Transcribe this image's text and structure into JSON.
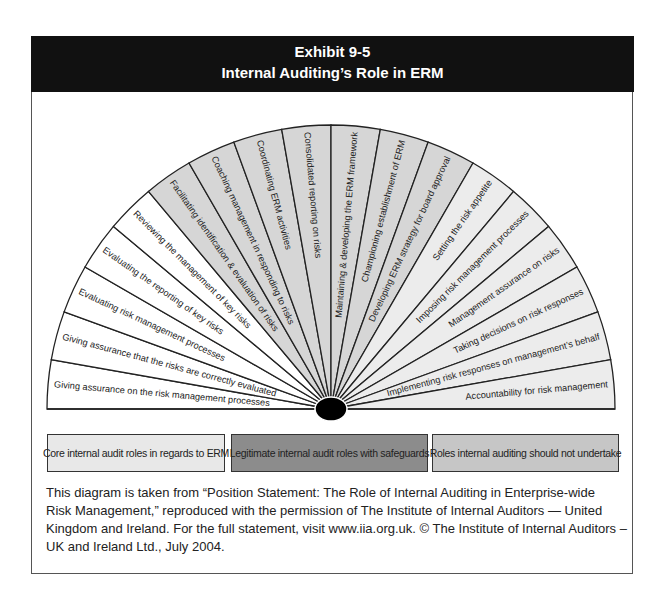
{
  "header": {
    "exhibit": "Exhibit 9-5",
    "title": "Internal Auditing’s Role in ERM"
  },
  "colors": {
    "header_bg": "#111111",
    "core": "#ffffff",
    "legitimate": "#d6d6d6",
    "not_undertake": "#ececec",
    "legend_core": "#e8e8e8",
    "legend_legitimate": "#8c8c8c",
    "legend_not_undertake": "#c6c6c6",
    "line": "#222222",
    "hub": "#000000"
  },
  "fan": {
    "wedges": [
      {
        "label": "Giving assurance on the risk management processes",
        "category": "core"
      },
      {
        "label": "Giving assurance that the risks are correctly evaluated",
        "category": "core"
      },
      {
        "label": "Evaluating risk management processes",
        "category": "core"
      },
      {
        "label": "Evaluating the reporting of key risks",
        "category": "core"
      },
      {
        "label": "Reviewing the management of key risks",
        "category": "core"
      },
      {
        "label": "Facilitating identification & evaluation of risks",
        "category": "legitimate"
      },
      {
        "label": "Coaching management in responding to risks",
        "category": "legitimate"
      },
      {
        "label": "Coordinating ERM activities",
        "category": "legitimate"
      },
      {
        "label": "Consolidated reporting on risks",
        "category": "legitimate"
      },
      {
        "label": "Maintaining & developing the ERM framework",
        "category": "legitimate"
      },
      {
        "label": "Championing establishment of ERM",
        "category": "legitimate"
      },
      {
        "label": "Developing ERM strategy for board approval",
        "category": "legitimate"
      },
      {
        "label": "Setting the risk appetite",
        "category": "not_undertake"
      },
      {
        "label": "Imposing risk management processes",
        "category": "not_undertake"
      },
      {
        "label": "Management assurance on risks",
        "category": "not_undertake"
      },
      {
        "label": "Taking decisions on risk responses",
        "category": "not_undertake"
      },
      {
        "label": "Implementing risk responses on management’s behalf",
        "category": "not_undertake"
      },
      {
        "label": "Accountability for risk management",
        "category": "not_undertake"
      }
    ]
  },
  "legend": [
    {
      "label": "Core internal audit roles in regards to ERM",
      "category": "core"
    },
    {
      "label": "Legitimate internal audit roles with safeguards",
      "category": "legitimate"
    },
    {
      "label": "Roles internal auditing should not undertake",
      "category": "not_undertake"
    }
  ],
  "caption": {
    "lines": [
      "This diagram is taken from “Position Statement: The Role of Internal Auditing in Enterprise-wide",
      "Risk Management,” reproduced with the permission of The Institute of Internal Auditors — United",
      "Kingdom and Ireland. For the full statement, visit www.iia.org.uk. © The Institute of Internal Auditors –",
      "UK and Ireland Ltd., July 2004."
    ]
  }
}
